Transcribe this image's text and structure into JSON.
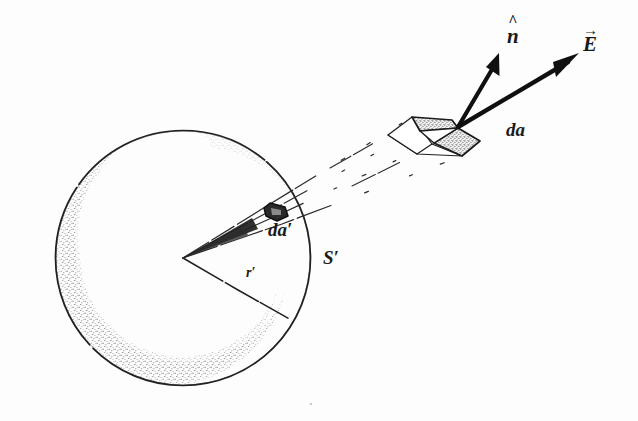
{
  "figure": {
    "background_color": "#fdfdfd",
    "ink_color": "#1a1a1a",
    "stipple_color": "#8a8a8a"
  },
  "labels": {
    "normal_vector": "n",
    "normal_accent": "^",
    "field_vector": "E",
    "field_accent": "→",
    "area_element": "da",
    "projected_area_element": "da′",
    "sphere_surface": "S′",
    "radius": "r′"
  },
  "geometry": {
    "sphere": {
      "center_x": 183,
      "center_y": 258,
      "radius": 128,
      "stroke_width": 1.6
    },
    "cone_apex_x": 183,
    "cone_apex_y": 258,
    "da_prime_x": 278,
    "da_prime_y": 208,
    "da_patch_x": 440,
    "da_patch_y": 128,
    "vector_origin_x": 458,
    "vector_origin_y": 127,
    "normal_tip_x": 499,
    "normal_tip_y": 54,
    "field_tip_x": 578,
    "field_tip_y": 54,
    "radius_end_x": 293,
    "radius_end_y": 320
  },
  "label_positions": {
    "normal_vector": {
      "x": 507,
      "y": 26
    },
    "field_vector": {
      "x": 583,
      "y": 34
    },
    "area_element": {
      "x": 506,
      "y": 120
    },
    "projected_area_element": {
      "x": 268,
      "y": 220
    },
    "sphere_surface": {
      "x": 323,
      "y": 248
    },
    "radius": {
      "x": 246,
      "y": 266
    }
  }
}
